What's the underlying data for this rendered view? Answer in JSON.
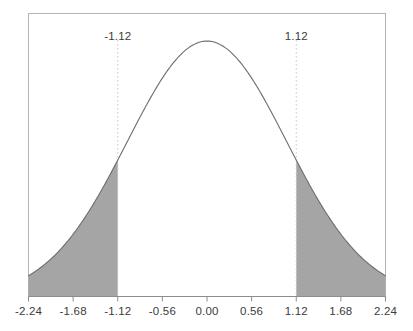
{
  "chart_data": {
    "type": "area",
    "title": "",
    "xlabel": "",
    "ylabel": "",
    "distribution": "standard normal",
    "mean": 0,
    "sd": 1,
    "xlim": [
      -2.24,
      2.24
    ],
    "ylim": [
      0,
      0.4418
    ],
    "grid": false,
    "legend": null,
    "x_tick_labels": [
      "-2.24",
      "-1.68",
      "-1.12",
      "-0.56",
      "0.00",
      "0.56",
      "1.12",
      "1.68",
      "2.24"
    ],
    "x_tick_values": [
      -2.24,
      -1.68,
      -1.12,
      -0.56,
      0.0,
      0.56,
      1.12,
      1.68,
      2.24
    ],
    "y_tick_labels": [],
    "annotations": [
      {
        "text": "-1.12",
        "x": -1.12,
        "position": "top"
      },
      {
        "text": "1.12",
        "x": 1.12,
        "position": "top"
      }
    ],
    "reference_lines": [
      {
        "x": -1.12,
        "style": "dotted",
        "color": "#c9c9c9"
      },
      {
        "x": 1.12,
        "style": "dotted",
        "color": "#c9c9c9"
      }
    ],
    "shaded_regions": [
      {
        "name": "left-tail",
        "from": -2.24,
        "to": -1.12,
        "color": "#a5a5a5"
      },
      {
        "name": "right-tail",
        "from": 1.12,
        "to": 2.24,
        "color": "#a5a5a5"
      }
    ],
    "series": [
      {
        "name": "normal-pdf",
        "color": "#6d6d6d",
        "x": [
          -2.24,
          -2.1,
          -1.96,
          -1.82,
          -1.68,
          -1.54,
          -1.4,
          -1.26,
          -1.12,
          -0.98,
          -0.84,
          -0.7,
          -0.56,
          -0.42,
          -0.28,
          -0.14,
          0.0,
          0.14,
          0.28,
          0.42,
          0.56,
          0.7,
          0.84,
          0.98,
          1.12,
          1.26,
          1.4,
          1.54,
          1.68,
          1.82,
          1.96,
          2.1,
          2.24
        ],
        "values": [
          0.0325,
          0.044,
          0.0584,
          0.0761,
          0.0973,
          0.1219,
          0.1497,
          0.1804,
          0.2131,
          0.2468,
          0.2803,
          0.3123,
          0.341,
          0.3653,
          0.3836,
          0.3951,
          0.3989,
          0.3951,
          0.3836,
          0.3653,
          0.341,
          0.3123,
          0.2803,
          0.2468,
          0.2131,
          0.1804,
          0.1497,
          0.1219,
          0.0973,
          0.0761,
          0.0584,
          0.044,
          0.0325
        ]
      }
    ]
  },
  "axes": {
    "tick_labels": [
      {
        "text": "-2.24",
        "value": -2.24
      },
      {
        "text": "-1.68",
        "value": -1.68
      },
      {
        "text": "-1.12",
        "value": -1.12
      },
      {
        "text": "-0.56",
        "value": -0.56
      },
      {
        "text": "0.00",
        "value": 0.0
      },
      {
        "text": "0.56",
        "value": 0.56
      },
      {
        "text": "1.12",
        "value": 1.12
      },
      {
        "text": "1.68",
        "value": 1.68
      },
      {
        "text": "2.24",
        "value": 2.24
      }
    ]
  },
  "critical_labels": [
    {
      "text": "-1.12",
      "value": -1.12
    },
    {
      "text": "1.12",
      "value": 1.12
    }
  ],
  "colors": {
    "curve": "#6d6d6d",
    "fill": "#a5a5a5",
    "frame": "#b4b4b4",
    "dotted": "#cfcfcf",
    "text": "#3b3b3b",
    "baseline": "#8c8c8c"
  }
}
